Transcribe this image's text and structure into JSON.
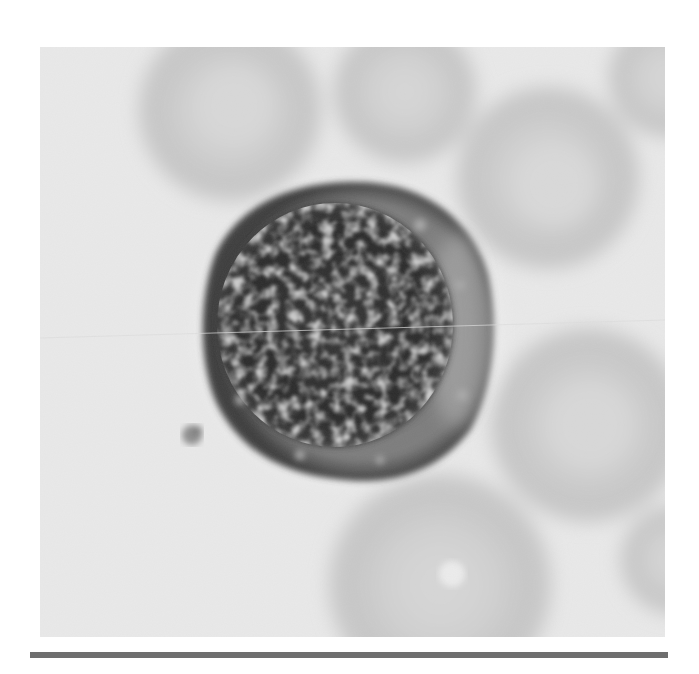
{
  "image": {
    "subject": "blood smear micrograph",
    "description": "Grayscale micrograph of a mononuclear white blood cell (lymphocyte) with dense granular nucleus, surrounded by faint red blood cells",
    "colors": {
      "background": "#ffffff",
      "field": "#e9e9e9",
      "rbc": "#c9c9c9",
      "rbc_center": "#dadada",
      "cytoplasm": "#7a7a7a",
      "nucleus": "#2e2e2e",
      "bar": "#6e6e6e"
    },
    "cells": {
      "wbc": {
        "cx": 348,
        "cy": 330,
        "r": 146
      },
      "nucleus": {
        "cx": 335,
        "cy": 325,
        "rx": 118,
        "ry": 122
      },
      "particle": {
        "cx": 192,
        "cy": 435,
        "r": 11
      },
      "rbcs": [
        {
          "cx": 230,
          "cy": 110,
          "r": 92
        },
        {
          "cx": 405,
          "cy": 92,
          "r": 72
        },
        {
          "cx": 548,
          "cy": 178,
          "r": 92
        },
        {
          "cx": 668,
          "cy": 78,
          "r": 60
        },
        {
          "cx": 588,
          "cy": 425,
          "r": 98
        },
        {
          "cx": 440,
          "cy": 585,
          "r": 112
        },
        {
          "cx": 675,
          "cy": 560,
          "r": 55
        }
      ]
    }
  }
}
